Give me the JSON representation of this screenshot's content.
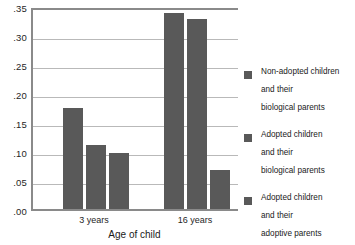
{
  "chart_data": {
    "type": "bar",
    "title": "",
    "subtitle": "",
    "xlabel": "Age of child",
    "ylabel": "",
    "categories": [
      "3 years",
      "16 years"
    ],
    "series": [
      {
        "name": "Non-adopted children and their biological parents",
        "values": [
          0.175,
          0.338
        ]
      },
      {
        "name": "Adopted children and their biological parents",
        "values": [
          0.111,
          0.327
        ]
      },
      {
        "name": "Adopted children and their adoptive parents",
        "values": [
          0.096,
          0.068
        ]
      }
    ],
    "ylim": [
      0.0,
      0.35
    ],
    "ytick_values": [
      0.0,
      0.05,
      0.1,
      0.15,
      0.2,
      0.25,
      0.3,
      0.35
    ],
    "ytick_labels": [
      ".00",
      ".05",
      ".10",
      ".15",
      ".20",
      ".25",
      ".30",
      ".35"
    ],
    "grid": true,
    "grid_axis": "y",
    "legend_position": "right",
    "bar_color": "#595959",
    "grid_color": "#b9b9b9",
    "axis_color": "#8a8a8a",
    "background": "#ffffff"
  },
  "legend": {
    "entries": [
      {
        "label": "Non-adopted children\nand their\nbiological parents",
        "color": "#595959"
      },
      {
        "label": "Adopted children\nand their\nbiological parents",
        "color": "#595959"
      },
      {
        "label": "Adopted children\nand  their\nadoptive parents",
        "color": "#595959"
      }
    ]
  }
}
